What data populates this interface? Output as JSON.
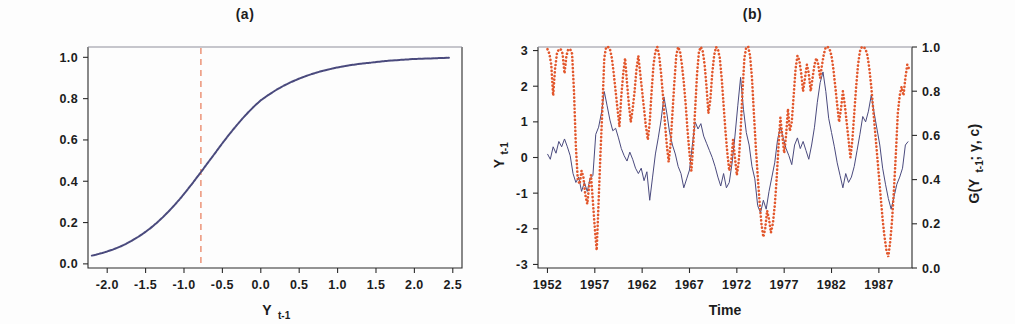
{
  "figure": {
    "background": "#fdfdfd",
    "panels": [
      "a",
      "b"
    ]
  },
  "panel_a": {
    "title": "(a)",
    "xlabel": "Y",
    "xlabel_sub": "t-1",
    "ylabel": "",
    "colors": {
      "curve": "#4a4a7d",
      "threshold": "#ec9478",
      "axis": "#2b2b2b"
    },
    "threshold_label": "c",
    "x_ticks": [
      "-2.0",
      "-1.5",
      "-1.0",
      "-0.5",
      "0.0",
      "0.5",
      "1.0",
      "1.5",
      "2.0",
      "2.5"
    ],
    "x_tick_values": [
      -2.0,
      -1.5,
      -1.0,
      -0.5,
      0.0,
      0.5,
      1.0,
      1.5,
      2.0,
      2.5
    ],
    "y_ticks": [
      "0.0",
      "0.2",
      "0.4",
      "0.6",
      "0.8",
      "1.0"
    ],
    "y_tick_values": [
      0.0,
      0.2,
      0.4,
      0.6,
      0.8,
      1.0
    ]
  },
  "panel_b": {
    "title": "(b)",
    "xlabel": "Time",
    "ylabel_left": "Y",
    "ylabel_left_sub": "t-1",
    "ylabel_right": "G(Y",
    "ylabel_right_sub": "t-1",
    "ylabel_right_tail": "; γ, c)",
    "colors": {
      "level_series": "#4a4a7d",
      "transition_series": "#e2572c",
      "axis": "#2b2b2b"
    },
    "x_ticks": [
      "1952",
      "1957",
      "1962",
      "1967",
      "1972",
      "1977",
      "1982",
      "1987"
    ],
    "x_tick_values": [
      1952,
      1957,
      1962,
      1967,
      1972,
      1977,
      1982,
      1987
    ],
    "y_ticks_left": [
      "-3",
      "-2",
      "-1",
      "0",
      "1",
      "2",
      "3"
    ],
    "y_tick_values_left": [
      -3,
      -2,
      -1,
      0,
      1,
      2,
      3
    ],
    "y_ticks_right": [
      "0.0",
      "0.2",
      "0.4",
      "0.6",
      "0.8",
      "1.0"
    ],
    "y_tick_values_right": [
      0.0,
      0.2,
      0.4,
      0.6,
      0.8,
      1.0
    ]
  },
  "chart_data": [
    {
      "id": "panel_a",
      "type": "scatter",
      "title": "(a)",
      "xlabel": "Y_{t-1}",
      "ylabel": "G(Y_{t-1}; gamma, c)",
      "xlim": [
        -2.25,
        2.62
      ],
      "ylim": [
        -0.02,
        1.05
      ],
      "grid": false,
      "legend": "none",
      "description": "Logistic transition function G plotted against the lagged series Y_{t-1}; dashed vertical line marks the threshold c.",
      "annotations": [
        {
          "type": "vline",
          "x": -0.78,
          "style": "dashed",
          "color": "#ec9478",
          "label": "c"
        }
      ],
      "series": [
        {
          "name": "G(Y_{t-1}; gamma, c)",
          "color": "#4a4a7d",
          "style": "dotted-dense",
          "logistic_fit": {
            "gamma": 1.85,
            "c": -0.78
          },
          "x": [
            -2.2,
            -2.14,
            -2.08,
            -2.0,
            -1.92,
            -1.84,
            -1.76,
            -1.68,
            -1.6,
            -1.52,
            -1.44,
            -1.36,
            -1.28,
            -1.2,
            -1.12,
            -1.04,
            -0.96,
            -0.88,
            -0.8,
            -0.72,
            -0.64,
            -0.56,
            -0.48,
            -0.4,
            -0.32,
            -0.24,
            -0.16,
            -0.08,
            0.0,
            0.1,
            0.2,
            0.3,
            0.4,
            0.5,
            0.6,
            0.7,
            0.8,
            0.9,
            1.0,
            1.1,
            1.2,
            1.3,
            1.4,
            1.5,
            1.62,
            1.75,
            1.88,
            2.0,
            2.15,
            2.3,
            2.45
          ],
          "y": [
            0.04,
            0.045,
            0.051,
            0.06,
            0.07,
            0.082,
            0.096,
            0.112,
            0.13,
            0.15,
            0.172,
            0.197,
            0.224,
            0.254,
            0.286,
            0.32,
            0.357,
            0.395,
            0.434,
            0.474,
            0.514,
            0.554,
            0.594,
            0.632,
            0.668,
            0.703,
            0.735,
            0.765,
            0.792,
            0.818,
            0.842,
            0.863,
            0.881,
            0.897,
            0.911,
            0.923,
            0.934,
            0.943,
            0.951,
            0.958,
            0.964,
            0.969,
            0.973,
            0.977,
            0.982,
            0.986,
            0.989,
            0.992,
            0.994,
            0.996,
            0.998
          ]
        }
      ]
    },
    {
      "id": "panel_b",
      "type": "line",
      "title": "(b)",
      "xlabel": "Time",
      "ylabel": "Y_{t-1}",
      "ylabel_secondary": "G(Y_{t-1}; gamma, c)",
      "xlim": [
        1951.0,
        1990.5
      ],
      "ylim": [
        -3.1,
        3.1
      ],
      "ylim_secondary": [
        0.0,
        1.0
      ],
      "grid": false,
      "legend": "none",
      "description": "Monthly standardized series Y_{t-1} (solid blue, left axis) shown with the logistic transition variable G (dotted orange, right axis) over 1952-1990.",
      "series": [
        {
          "name": "Y_{t-1}",
          "axis": "left",
          "color": "#4a4a7d",
          "style": "solid",
          "x": [
            1952.0,
            1952.3,
            1952.6,
            1952.9,
            1953.2,
            1953.5,
            1953.8,
            1954.1,
            1954.4,
            1954.7,
            1955.0,
            1955.3,
            1955.6,
            1955.9,
            1956.2,
            1956.5,
            1956.8,
            1957.1,
            1957.4,
            1957.7,
            1958.0,
            1958.3,
            1958.6,
            1958.9,
            1959.2,
            1959.5,
            1959.8,
            1960.1,
            1960.4,
            1960.7,
            1961.0,
            1961.3,
            1961.6,
            1961.9,
            1962.2,
            1962.5,
            1962.8,
            1963.1,
            1963.4,
            1963.7,
            1964.0,
            1964.3,
            1964.6,
            1964.9,
            1965.2,
            1965.5,
            1965.8,
            1966.1,
            1966.4,
            1966.7,
            1967.0,
            1967.3,
            1967.6,
            1967.9,
            1968.2,
            1968.5,
            1968.8,
            1969.1,
            1969.4,
            1969.7,
            1970.0,
            1970.3,
            1970.6,
            1970.9,
            1971.2,
            1971.5,
            1971.8,
            1972.1,
            1972.4,
            1972.7,
            1973.0,
            1973.3,
            1973.6,
            1973.9,
            1974.2,
            1974.5,
            1974.8,
            1975.1,
            1975.4,
            1975.7,
            1976.0,
            1976.3,
            1976.6,
            1976.9,
            1977.2,
            1977.5,
            1977.8,
            1978.1,
            1978.4,
            1978.7,
            1979.0,
            1979.3,
            1979.6,
            1979.9,
            1980.2,
            1980.5,
            1980.8,
            1981.1,
            1981.4,
            1981.7,
            1982.0,
            1982.3,
            1982.6,
            1982.9,
            1983.2,
            1983.5,
            1983.8,
            1984.1,
            1984.4,
            1984.7,
            1985.0,
            1985.3,
            1985.6,
            1985.9,
            1986.2,
            1986.5,
            1986.8,
            1987.1,
            1987.4,
            1987.7,
            1988.0,
            1988.3,
            1988.6,
            1988.9,
            1989.2,
            1989.5,
            1989.8,
            1990.1
          ],
          "y": [
            0.1,
            -0.05,
            0.3,
            0.12,
            0.45,
            0.3,
            0.52,
            0.3,
            0.05,
            -0.45,
            -0.7,
            -0.55,
            -0.95,
            -0.7,
            -0.95,
            -0.6,
            -0.5,
            0.65,
            0.85,
            1.25,
            1.85,
            1.45,
            1.05,
            0.75,
            0.82,
            0.55,
            0.25,
            0.05,
            -0.1,
            0.15,
            -0.05,
            -0.3,
            -0.45,
            -0.3,
            -0.65,
            -0.4,
            -1.2,
            -0.55,
            0.1,
            0.55,
            1.05,
            1.7,
            1.25,
            0.7,
            0.35,
            0.1,
            -0.25,
            -0.45,
            -0.85,
            -0.6,
            -0.35,
            0.35,
            1.0,
            0.8,
            0.95,
            0.6,
            0.4,
            0.2,
            0.0,
            -0.25,
            -0.55,
            -0.8,
            -0.45,
            -0.85,
            -0.7,
            -0.15,
            0.6,
            1.45,
            2.25,
            1.35,
            0.7,
            0.35,
            -0.25,
            -0.6,
            -1.35,
            -1.55,
            -1.2,
            -1.45,
            -0.95,
            -0.55,
            -0.15,
            0.5,
            0.85,
            0.55,
            0.25,
            0.05,
            -0.2,
            0.35,
            0.55,
            0.25,
            0.45,
            0.2,
            -0.05,
            0.35,
            0.85,
            1.55,
            2.1,
            2.4,
            1.85,
            1.1,
            0.7,
            0.3,
            -0.15,
            -0.5,
            -0.85,
            -0.45,
            -0.7,
            -0.55,
            -0.25,
            0.2,
            0.65,
            1.15,
            1.0,
            1.3,
            1.75,
            1.25,
            0.8,
            0.35,
            -0.3,
            -0.75,
            -1.15,
            -1.45,
            -1.1,
            -0.75,
            -0.55,
            -0.3,
            0.35,
            0.45
          ]
        },
        {
          "name": "G(Y_{t-1}; gamma, c)",
          "axis": "right",
          "color": "#e2572c",
          "style": "dotted",
          "x": [
            1952.0,
            1952.2,
            1952.4,
            1952.6,
            1952.8,
            1953.0,
            1953.2,
            1953.4,
            1953.6,
            1953.8,
            1954.0,
            1954.2,
            1954.4,
            1954.6,
            1954.8,
            1955.0,
            1955.2,
            1955.4,
            1955.6,
            1955.8,
            1956.0,
            1956.2,
            1956.4,
            1956.6,
            1956.8,
            1957.0,
            1957.2,
            1957.4,
            1957.6,
            1957.8,
            1958.0,
            1958.2,
            1958.4,
            1958.6,
            1958.8,
            1959.0,
            1959.2,
            1959.4,
            1959.6,
            1959.8,
            1960.0,
            1960.2,
            1960.4,
            1960.6,
            1960.8,
            1961.0,
            1961.2,
            1961.4,
            1961.6,
            1961.8,
            1962.0,
            1962.2,
            1962.4,
            1962.6,
            1962.8,
            1963.0,
            1963.2,
            1963.4,
            1963.6,
            1963.8,
            1964.0,
            1964.2,
            1964.4,
            1964.6,
            1964.8,
            1965.0,
            1965.2,
            1965.4,
            1965.6,
            1965.8,
            1966.0,
            1966.2,
            1966.4,
            1966.6,
            1966.8,
            1967.0,
            1967.2,
            1967.4,
            1967.6,
            1967.8,
            1968.0,
            1968.2,
            1968.4,
            1968.6,
            1968.8,
            1969.0,
            1969.2,
            1969.4,
            1969.6,
            1969.8,
            1970.0,
            1970.2,
            1970.4,
            1970.6,
            1970.8,
            1971.0,
            1971.2,
            1971.4,
            1971.6,
            1971.8,
            1972.0,
            1972.2,
            1972.4,
            1972.6,
            1972.8,
            1973.0,
            1973.2,
            1973.4,
            1973.6,
            1973.8,
            1974.0,
            1974.2,
            1974.4,
            1974.6,
            1974.8,
            1975.0,
            1975.2,
            1975.4,
            1975.6,
            1975.8,
            1976.0,
            1976.2,
            1976.4,
            1976.6,
            1976.8,
            1977.0,
            1977.2,
            1977.4,
            1977.6,
            1977.8,
            1978.0,
            1978.2,
            1978.4,
            1978.6,
            1978.8,
            1979.0,
            1979.2,
            1979.4,
            1979.6,
            1979.8,
            1980.0,
            1980.2,
            1980.4,
            1980.6,
            1980.8,
            1981.0,
            1981.2,
            1981.4,
            1981.6,
            1981.8,
            1982.0,
            1982.2,
            1982.4,
            1982.6,
            1982.8,
            1983.0,
            1983.2,
            1983.4,
            1983.6,
            1983.8,
            1984.0,
            1984.2,
            1984.4,
            1984.6,
            1984.8,
            1985.0,
            1985.2,
            1985.4,
            1985.6,
            1985.8,
            1986.0,
            1986.2,
            1986.4,
            1986.6,
            1986.8,
            1987.0,
            1987.2,
            1987.4,
            1987.6,
            1987.8,
            1988.0,
            1988.2,
            1988.4,
            1988.6,
            1988.8,
            1989.0,
            1989.2,
            1989.4,
            1989.6,
            1989.8,
            1990.0,
            1990.2
          ],
          "y": [
            0.99,
            0.97,
            0.92,
            0.78,
            0.9,
            0.97,
            0.99,
            0.99,
            0.97,
            0.88,
            0.96,
            0.99,
            0.99,
            0.97,
            0.8,
            0.55,
            0.4,
            0.38,
            0.44,
            0.41,
            0.33,
            0.29,
            0.37,
            0.42,
            0.3,
            0.18,
            0.08,
            0.3,
            0.52,
            0.72,
            0.95,
            1.0,
            1.0,
            0.99,
            0.95,
            0.88,
            0.8,
            0.72,
            0.64,
            0.78,
            0.88,
            0.95,
            0.84,
            0.74,
            0.66,
            0.72,
            0.8,
            0.9,
            0.96,
            0.88,
            0.8,
            0.72,
            0.64,
            0.58,
            0.66,
            0.8,
            0.92,
            0.98,
            1.0,
            0.96,
            0.88,
            0.78,
            0.66,
            0.56,
            0.48,
            0.56,
            0.7,
            0.84,
            0.96,
            1.0,
            0.98,
            0.92,
            0.84,
            0.74,
            0.62,
            0.52,
            0.44,
            0.56,
            0.72,
            0.88,
            0.98,
            1.0,
            0.98,
            0.92,
            0.82,
            0.7,
            0.76,
            0.88,
            0.96,
            1.0,
            0.99,
            0.95,
            0.86,
            0.74,
            0.62,
            0.52,
            0.44,
            0.48,
            0.58,
            0.5,
            0.42,
            0.48,
            0.62,
            0.8,
            0.95,
            1.0,
            1.0,
            0.96,
            0.86,
            0.7,
            0.55,
            0.42,
            0.3,
            0.2,
            0.14,
            0.18,
            0.26,
            0.22,
            0.16,
            0.2,
            0.28,
            0.4,
            0.55,
            0.68,
            0.6,
            0.52,
            0.6,
            0.72,
            0.62,
            0.66,
            0.78,
            0.9,
            0.96,
            0.94,
            0.88,
            0.8,
            0.86,
            0.92,
            0.88,
            0.8,
            0.86,
            0.92,
            0.95,
            0.92,
            0.86,
            0.92,
            0.97,
            1.0,
            1.0,
            0.99,
            0.96,
            0.9,
            0.82,
            0.74,
            0.66,
            0.72,
            0.8,
            0.74,
            0.66,
            0.58,
            0.5,
            0.58,
            0.7,
            0.82,
            0.92,
            0.98,
            1.0,
            1.0,
            0.99,
            0.96,
            0.9,
            0.82,
            0.72,
            0.62,
            0.52,
            0.42,
            0.32,
            0.22,
            0.14,
            0.08,
            0.05,
            0.12,
            0.22,
            0.36,
            0.52,
            0.7,
            0.78,
            0.82,
            0.78,
            0.86,
            0.92,
            0.9
          ]
        }
      ]
    }
  ]
}
